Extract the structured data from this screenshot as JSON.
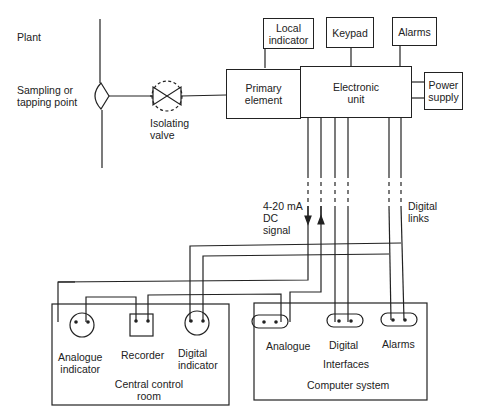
{
  "plant": {
    "label": "Plant",
    "sampling_point": "Sampling or\ntapping point",
    "isolating_valve": "Isolating\nvalve"
  },
  "transmitter": {
    "primary_element": "Primary\nelement",
    "electronic_unit": "Electronic\nunit",
    "power_supply": "Power\nsupply",
    "local_indicator": "Local\nindicator",
    "keypad": "Keypad",
    "alarms": "Alarms"
  },
  "signals": {
    "analogue": "4-20 mA\nDC\nsignal",
    "digital": "Digital\nlinks"
  },
  "central_control_room": {
    "title": "Central control\nroom",
    "analogue_indicator": "Analogue\nindicator",
    "recorder": "Recorder",
    "digital_indicator": "Digital\nindicator"
  },
  "computer_system": {
    "title": "Computer system",
    "interfaces_label": "Interfaces",
    "analogue": "Analogue",
    "digital": "Digital",
    "alarms": "Alarms"
  },
  "colors": {
    "line": "#222222",
    "background": "#ffffff"
  }
}
